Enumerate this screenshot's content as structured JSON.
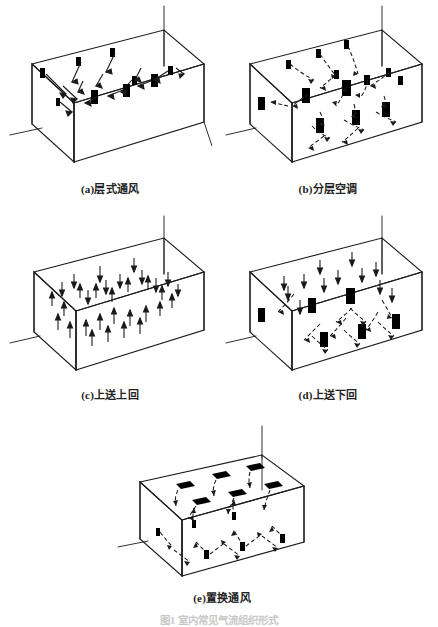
{
  "figure": {
    "background_color": "#ffffff",
    "line_color": "#1a1a1a",
    "vent_color": "#000000",
    "caption_color": "#222222",
    "bottom_caption": "图1  室内常见气流组织形式",
    "bottom_caption_visible": "partially cut off at image edge"
  },
  "panels": [
    {
      "id": "a",
      "label": "(a)层式通风",
      "scheme": "stratified-ventilation",
      "supply_position": "wall mid-height",
      "return_position": "wall mid-height",
      "flow_style": "straight",
      "vent_count_upper": 5,
      "vent_count_lower": 4,
      "arrow_count": 14
    },
    {
      "id": "b",
      "label": "(b)分层空调",
      "scheme": "stratified-air-conditioning",
      "supply_position": "mid-height side walls",
      "return_position": "mid-height and low",
      "flow_style": "curved",
      "vent_count_upper": 8,
      "vent_count_lower": 5,
      "arrow_count": 22
    },
    {
      "id": "c",
      "label": "(c)上送上回",
      "scheme": "top-supply-top-return",
      "supply_position": "ceiling",
      "return_position": "ceiling",
      "flow_style": "straight vertical",
      "vent_count_upper": 0,
      "vent_count_lower": 0,
      "arrow_count": 34
    },
    {
      "id": "d",
      "label": "(d)上送下回",
      "scheme": "top-supply-bottom-return",
      "supply_position": "ceiling",
      "return_position": "floor level",
      "flow_style": "straight then curved",
      "vent_count_upper": 3,
      "vent_count_lower": 4,
      "arrow_count": 26
    },
    {
      "id": "e",
      "label": "(e)置换通风",
      "scheme": "displacement-ventilation",
      "supply_position": "floor level",
      "return_position": "ceiling",
      "flow_style": "rising curved",
      "vent_count_upper": 7,
      "vent_count_lower": 9,
      "arrow_count": 20
    }
  ]
}
